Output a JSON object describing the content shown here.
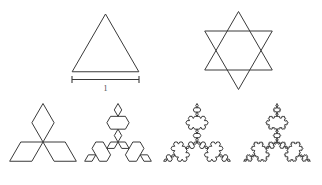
{
  "figure": {
    "width": 322,
    "height": 185,
    "background_color": "#ffffff",
    "stroke_color": "#3a3a3a"
  },
  "measurement": {
    "label": "1",
    "name": "unit-length-label",
    "x1": 72,
    "x2": 139,
    "y": 79.5,
    "tick_half_height": 3.5,
    "label_x": 105.5,
    "label_y": 91
  },
  "chart_data": {
    "type": "diagram",
    "shapes": [
      {
        "name": "equilateral-triangle",
        "iteration": 0,
        "style": "triangle",
        "center_x": 105.5,
        "center_y": 52.5,
        "radius": 38.5,
        "rotation": -90,
        "label": "Initiator: equilateral triangle, side 1"
      },
      {
        "name": "hexagram-overlapping-triangles",
        "iteration": 1,
        "style": "two-triangles",
        "center_x": 238.5,
        "center_y": 50.5,
        "radius": 39,
        "rotation": -90,
        "label": "Two overlapping triangles forming a hexagram"
      },
      {
        "name": "koch-snowflake-iteration-1",
        "iteration": 1,
        "style": "koch",
        "center_x": 43,
        "center_y": 142,
        "radius": 38.5,
        "rotation": -90,
        "label": "Koch snowflake, iteration 1"
      },
      {
        "name": "koch-snowflake-iteration-2",
        "iteration": 2,
        "style": "koch",
        "center_x": 118,
        "center_y": 142,
        "radius": 38.5,
        "rotation": -90,
        "label": "Koch snowflake, iteration 2"
      },
      {
        "name": "koch-snowflake-iteration-3",
        "iteration": 3,
        "style": "koch",
        "center_x": 197,
        "center_y": 142,
        "radius": 38.5,
        "rotation": -90,
        "label": "Koch snowflake, iteration 3"
      },
      {
        "name": "koch-snowflake-iteration-4",
        "iteration": 4,
        "style": "koch",
        "center_x": 277,
        "center_y": 142,
        "radius": 38.5,
        "rotation": -90,
        "label": "Koch snowflake, iteration 4"
      }
    ]
  }
}
